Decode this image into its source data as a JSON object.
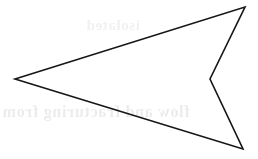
{
  "figure": {
    "name": "arrow-polygon",
    "canvas": {
      "width": 258,
      "height": 159,
      "background_color": "#ffffff"
    },
    "shape": {
      "type": "polygon",
      "closed": true,
      "fill": "none",
      "stroke_color": "#161616",
      "stroke_width": 1.6,
      "vertex_count": 4,
      "vertices": [
        {
          "label": "left-tip",
          "x": 15,
          "y": 79,
          "kind": "convex"
        },
        {
          "label": "top-right-tip",
          "x": 245,
          "y": 7,
          "kind": "convex"
        },
        {
          "label": "notch",
          "x": 210,
          "y": 79,
          "kind": "concave"
        },
        {
          "label": "bottom-right-tip",
          "x": 243,
          "y": 149,
          "kind": "convex"
        }
      ],
      "points_attr": "15,79 245,7 210,79 243,149"
    }
  },
  "ghost_text": {
    "description": "Faint mirrored show-through text bleeding from the reverse side of the scanned page",
    "top_line": "isolated",
    "bottom_line": "flow and fracturing from"
  }
}
